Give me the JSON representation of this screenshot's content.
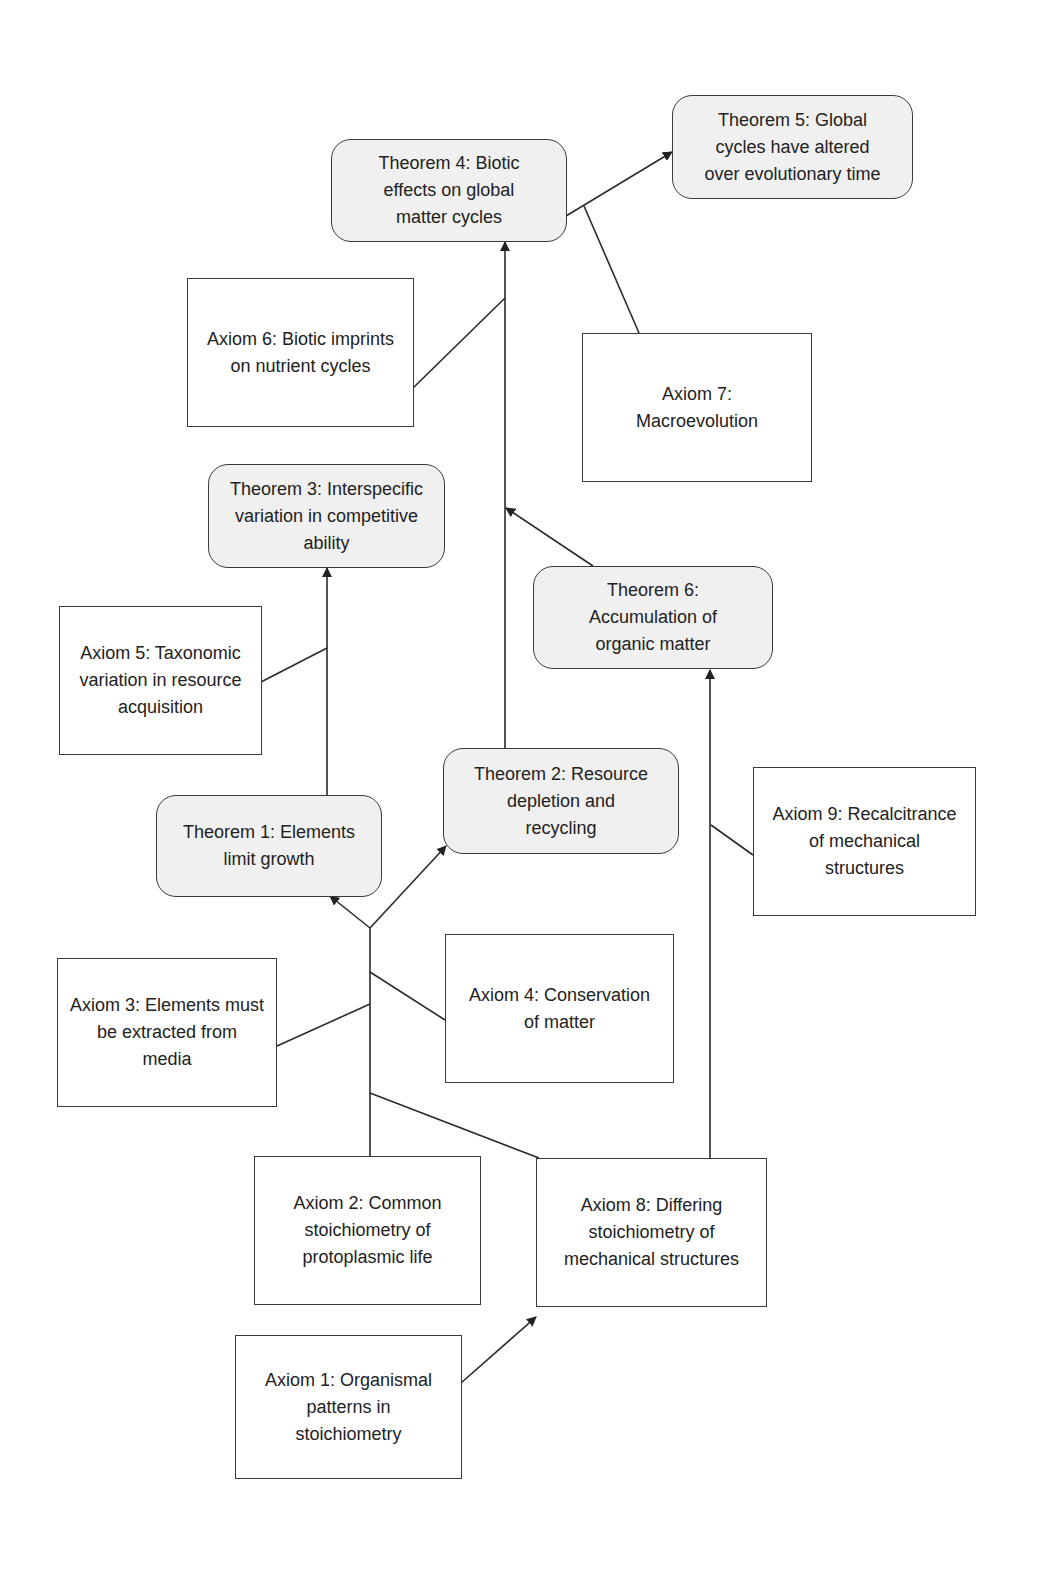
{
  "diagram": {
    "colors": {
      "theorem_fill": "#f0f0f0",
      "axiom_fill": "#ffffff",
      "stroke": "#3a3a3a",
      "text": "#222222"
    },
    "nodes": {
      "t4": {
        "label": "Theorem 4: Biotic effects on global matter cycles",
        "lines": [
          "Theorem 4: Biotic",
          "effects on global",
          "matter cycles"
        ],
        "type": "theorem"
      },
      "t5": {
        "label": "Theorem 5: Global cycles have altered over evolutionary time",
        "lines": [
          "Theorem 5: Global",
          "cycles have altered",
          "over evolutionary time"
        ],
        "type": "theorem"
      },
      "a6": {
        "label": "Axiom 6: Biotic imprints on nutrient cycles",
        "lines": [
          "Axiom 6: Biotic imprints",
          "on nutrient cycles"
        ],
        "type": "axiom"
      },
      "a7": {
        "label": "Axiom 7: Macroevolution",
        "lines": [
          "Axiom 7:",
          "Macroevolution"
        ],
        "type": "axiom"
      },
      "t3": {
        "label": "Theorem 3: Interspecific variation in competitive ability",
        "lines": [
          "Theorem 3: Interspecific",
          "variation in competitive",
          "ability"
        ],
        "type": "theorem"
      },
      "t6": {
        "label": "Theorem 6: Accumulation of organic matter",
        "lines": [
          "Theorem 6:",
          "Accumulation of",
          "organic matter"
        ],
        "type": "theorem"
      },
      "a5": {
        "label": "Axiom 5: Taxonomic variation in resource acquisition",
        "lines": [
          "Axiom 5: Taxonomic",
          "variation in resource",
          "acquisition"
        ],
        "type": "axiom"
      },
      "t2": {
        "label": "Theorem 2: Resource depletion and recycling",
        "lines": [
          "Theorem 2: Resource",
          "depletion and",
          "recycling"
        ],
        "type": "theorem"
      },
      "t1": {
        "label": "Theorem 1: Elements limit growth",
        "lines": [
          "Theorem 1: Elements",
          "limit growth"
        ],
        "type": "theorem"
      },
      "a9": {
        "label": "Axiom 9: Recalcitrance of mechanical structures",
        "lines": [
          "Axiom 9: Recalcitrance",
          "of mechanical",
          "structures"
        ],
        "type": "axiom"
      },
      "a4": {
        "label": "Axiom 4: Conservation of matter",
        "lines": [
          "Axiom 4: Conservation",
          "of matter"
        ],
        "type": "axiom"
      },
      "a3": {
        "label": "Axiom 3: Elements must be extracted from media",
        "lines": [
          "Axiom 3: Elements must",
          "be extracted from",
          "media"
        ],
        "type": "axiom"
      },
      "a2": {
        "label": "Axiom 2: Common stoichiometry of protoplasmic life",
        "lines": [
          "Axiom 2: Common",
          "stoichiometry  of",
          "protoplasmic life"
        ],
        "type": "axiom"
      },
      "a8": {
        "label": "Axiom 8: Differing stoichiometry of mechanical structures",
        "lines": [
          "Axiom 8: Differing",
          "stoichiometry  of",
          "mechanical structures"
        ],
        "type": "axiom"
      },
      "a1": {
        "label": "Axiom 1: Organismal patterns in stoichiometry",
        "lines": [
          "Axiom 1: Organismal",
          "patterns in",
          "stoichiometry"
        ],
        "type": "axiom"
      }
    },
    "edges": [
      {
        "from": "t4",
        "to": "t5",
        "arrow": true
      },
      {
        "from": "a7",
        "to": "t4-t5 link",
        "arrow": false
      },
      {
        "from": "t2",
        "to": "t4",
        "arrow": true
      },
      {
        "from": "a6",
        "to": "t2-t4 link",
        "arrow": false
      },
      {
        "from": "t6",
        "to": "t2-t4 link",
        "arrow": true
      },
      {
        "from": "t1",
        "to": "t3",
        "arrow": true
      },
      {
        "from": "a5",
        "to": "t1-t3 link",
        "arrow": false
      },
      {
        "from": "a2",
        "to": "t1",
        "arrow": true
      },
      {
        "from": "a2",
        "to": "t2",
        "arrow": true
      },
      {
        "from": "a4",
        "to": "a2 trunk",
        "arrow": false
      },
      {
        "from": "a3",
        "to": "a2 trunk",
        "arrow": false
      },
      {
        "from": "a8",
        "to": "a2 trunk",
        "arrow": false
      },
      {
        "from": "a8",
        "to": "t6",
        "arrow": true
      },
      {
        "from": "a9",
        "to": "a8-t6 link",
        "arrow": false
      },
      {
        "from": "a1",
        "to": "a8",
        "arrow": true
      }
    ]
  }
}
